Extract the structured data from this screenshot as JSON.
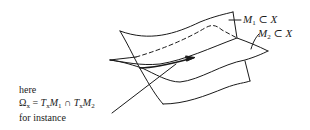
{
  "figure": {
    "surfaces": [
      {
        "name": "M1",
        "label": "M",
        "subscript": "1",
        "relation": "⊂",
        "space": "X"
      },
      {
        "name": "M2",
        "label": "M",
        "subscript": "2",
        "relation": "⊂",
        "space": "X"
      }
    ],
    "annotation": {
      "line1": "here",
      "omega": "Ω",
      "omega_sub": "x",
      "equals": " = ",
      "t1": "T",
      "t1_sub": "x",
      "m1": "M",
      "m1_sub": "1",
      "cap": " ∩ ",
      "t2": "T",
      "t2_sub": "x",
      "m2": "M",
      "m2_sub": "2",
      "line3": "for instance"
    },
    "stroke_color": "#1a1a1a",
    "background": "#ffffff"
  }
}
